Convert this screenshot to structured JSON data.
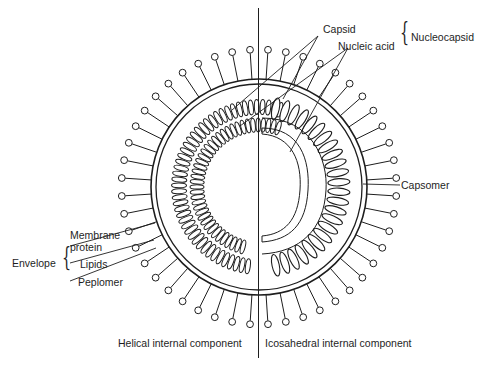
{
  "diagram": {
    "labels": {
      "capsid": "Capsid",
      "nucleic_acid": "Nucleic acid",
      "nucleocapsid": "Nucleocapsid",
      "capsomer": "Capsomer",
      "membrane_protein_line1": "Membrane",
      "membrane_protein_line2": "protein",
      "lipids": "Lipids",
      "peplomer": "Peplomer",
      "envelope": "Envelope",
      "helical": "Helical internal component",
      "icosahedral": "Icosahedral internal component"
    },
    "colors": {
      "stroke": "#1e1e1e",
      "background": "#ffffff"
    }
  }
}
